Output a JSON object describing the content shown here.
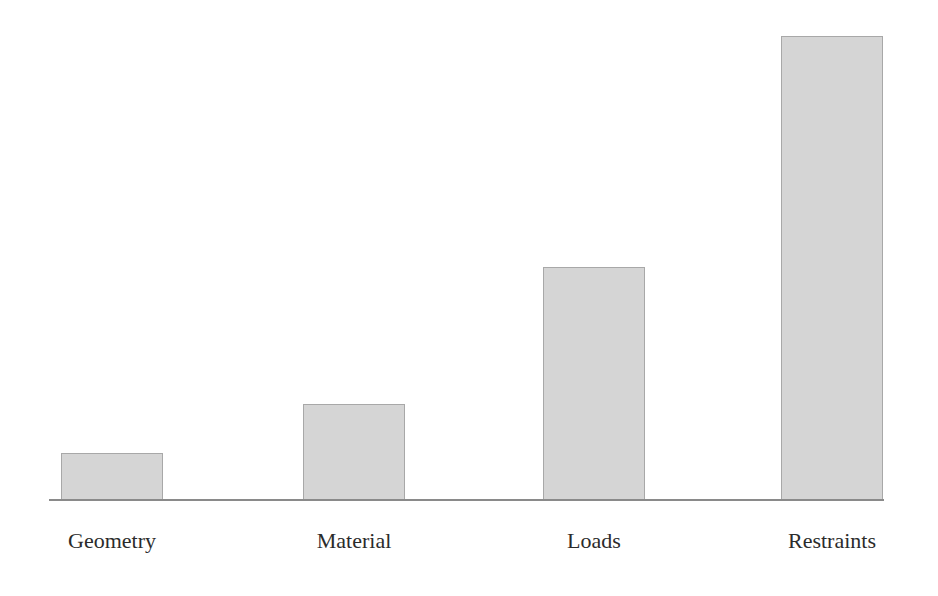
{
  "chart_data": {
    "type": "bar",
    "title": "",
    "subtitle": "",
    "xlabel": "",
    "ylabel": "",
    "categories": [
      "Geometry",
      "Material",
      "Loads",
      "Restraints"
    ],
    "values": [
      10,
      21,
      50,
      100
    ],
    "series": [
      {
        "name": "",
        "values": [
          10,
          21,
          50,
          100
        ]
      }
    ],
    "ylim": [
      0,
      100
    ],
    "grid": false,
    "legend": false,
    "legend_position": "none",
    "y_axis_visible": false,
    "x_axis_visible": true,
    "value_labels_visible": false,
    "annotations": []
  },
  "style": {
    "background_color": "#ffffff",
    "bar_fill_color": "#d5d5d5",
    "bar_border_color": "#a8a8a8",
    "axis_line_color": "#8a8a8a",
    "label_text_color": "#2b2b2b"
  },
  "geometry": {
    "baseline_y": 499,
    "axis_left": 49,
    "axis_width": 835,
    "bar_width": 102,
    "bars": [
      {
        "left": 61,
        "top": 453,
        "height": 47,
        "center": 112
      },
      {
        "left": 303,
        "top": 404,
        "height": 96,
        "center": 354
      },
      {
        "left": 543,
        "top": 267,
        "height": 233,
        "center": 594
      },
      {
        "left": 781,
        "top": 36,
        "height": 464,
        "center": 832
      }
    ]
  }
}
